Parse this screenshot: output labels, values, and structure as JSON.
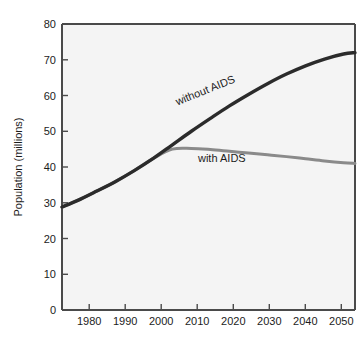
{
  "chart_data": {
    "type": "line",
    "title": "",
    "subtitle": "",
    "xlabel": "",
    "ylabel": "Population (millions)",
    "xlim": [
      1976,
      2053
    ],
    "ylim": [
      0,
      80
    ],
    "grid": false,
    "legend_position": "inline-annotations",
    "x_ticks": [
      "1980",
      "1990",
      "2000",
      "2010",
      "2020",
      "2030",
      "2040",
      "2050"
    ],
    "x_tick_values": [
      1980,
      1990,
      2000,
      2010,
      2020,
      2030,
      2040,
      2050
    ],
    "y_ticks": [
      "0",
      "10",
      "20",
      "30",
      "40",
      "50",
      "60",
      "70",
      "80"
    ],
    "y_tick_values": [
      0,
      10,
      20,
      30,
      40,
      50,
      60,
      70,
      80
    ],
    "x": [
      1976,
      1980,
      1985,
      1990,
      1995,
      2000,
      2005,
      2010,
      2015,
      2020,
      2025,
      2030,
      2035,
      2040,
      2045,
      2050,
      2053
    ],
    "series": [
      {
        "name": "without AIDS",
        "color": "#2b2b2b",
        "values": [
          28.8,
          30.6,
          33.2,
          35.9,
          39.0,
          42.4,
          46.2,
          50.0,
          53.6,
          57.1,
          60.3,
          63.3,
          66.0,
          68.3,
          70.2,
          71.6,
          72.0
        ]
      },
      {
        "name": "with AIDS",
        "color": "#8a8a8a",
        "values": [
          28.8,
          30.6,
          33.2,
          35.9,
          39.0,
          42.4,
          45.0,
          45.2,
          44.9,
          44.4,
          43.9,
          43.4,
          42.9,
          42.3,
          41.7,
          41.2,
          41.0
        ]
      }
    ],
    "annotations": [
      {
        "text": "without AIDS",
        "x": 2014,
        "y": 60.5,
        "rotation": -22
      },
      {
        "text": "with AIDS",
        "x": 2018,
        "y": 41.5,
        "rotation": 0
      }
    ]
  },
  "colors": {
    "plot_background": "#f4f4f4",
    "figure_background": "#ffffff",
    "axis": "#4a4a4a",
    "without_aids_line": "#2b2b2b",
    "with_aids_line": "#8a8a8a",
    "text": "#1c1c1c"
  }
}
